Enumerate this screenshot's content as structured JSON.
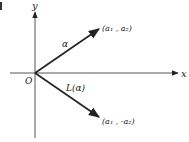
{
  "diagram": {
    "type": "vector-reflection",
    "axes": {
      "x_label": "x",
      "y_label": "y",
      "origin_label": "O"
    },
    "vectors": [
      {
        "name": "alpha",
        "label": "α",
        "endpoint_label": "(a₁ , a₂)"
      },
      {
        "name": "L-alpha",
        "label": "L(α)",
        "endpoint_label": "(a₁ , -a₂)"
      }
    ],
    "colors": {
      "ink": "#222222",
      "axis": "#555555",
      "background": "#ffffff"
    }
  }
}
